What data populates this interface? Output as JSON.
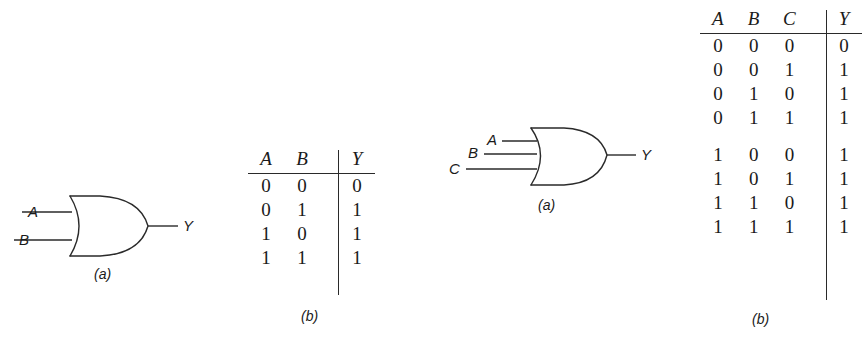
{
  "figure": {
    "line_color": "#2a2a2a",
    "background": "#ffffff"
  },
  "gate2": {
    "name": "two-input-or-gate",
    "inputs": [
      "A",
      "B"
    ],
    "output": "Y",
    "caption": "(a)"
  },
  "table2": {
    "name": "two-input-or-truth-table",
    "caption": "(b)",
    "headers": [
      "A",
      "B",
      "Y"
    ],
    "rows": [
      [
        "0",
        "0",
        "0"
      ],
      [
        "0",
        "1",
        "1"
      ],
      [
        "1",
        "0",
        "1"
      ],
      [
        "1",
        "1",
        "1"
      ]
    ]
  },
  "gate3": {
    "name": "three-input-or-gate",
    "inputs": [
      "A",
      "B",
      "C"
    ],
    "output": "Y",
    "caption": "(a)"
  },
  "table3": {
    "name": "three-input-or-truth-table",
    "caption": "(b)",
    "headers": [
      "A",
      "B",
      "C",
      "Y"
    ],
    "rows_top": [
      [
        "0",
        "0",
        "0",
        "0"
      ],
      [
        "0",
        "0",
        "1",
        "1"
      ],
      [
        "0",
        "1",
        "0",
        "1"
      ],
      [
        "0",
        "1",
        "1",
        "1"
      ]
    ],
    "rows_bottom": [
      [
        "1",
        "0",
        "0",
        "1"
      ],
      [
        "1",
        "0",
        "1",
        "1"
      ],
      [
        "1",
        "1",
        "0",
        "1"
      ],
      [
        "1",
        "1",
        "1",
        "1"
      ]
    ]
  }
}
